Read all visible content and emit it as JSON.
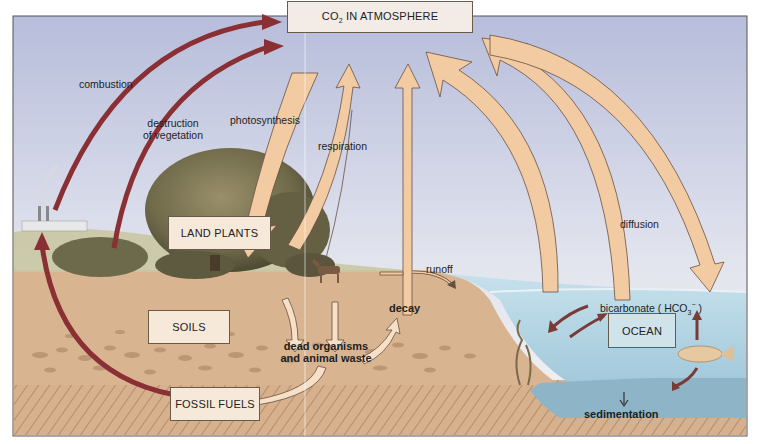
{
  "diagram": {
    "reservoirs": {
      "atmosphere": {
        "label_prefix": "CO",
        "label_sub": "2",
        "label_suffix": " IN ATMOSPHERE"
      },
      "land_plants": {
        "label": "LAND PLANTS"
      },
      "soils": {
        "label": "SOILS"
      },
      "fossil_fuels": {
        "label": "FOSSIL FUELS"
      },
      "ocean": {
        "label": "OCEAN"
      }
    },
    "processes": {
      "combustion": "combustion",
      "destruction_line1": "destruction",
      "destruction_line2": "of vegetation",
      "photosynthesis": "photosynthesis",
      "respiration": "respiration",
      "decay_top": "decay",
      "runoff": "runoff",
      "diffusion": "diffusion",
      "dead_line1": "dead organisms",
      "dead_line2": "and animal waste",
      "bicarbonate_prefix": "bicarbonate ( HCO",
      "bicarbonate_sub": "3",
      "bicarbonate_sup": "−",
      "bicarbonate_suffix": " )",
      "sedimentation": "sedimentation"
    },
    "colors": {
      "sky_top": "#b9bfdc",
      "sky_bottom": "#eef0f2",
      "soil": "#d9b592",
      "soil_dark": "#b88e6a",
      "bedrock_hatch": "#a07a5a",
      "ocean": "#a9cfe0",
      "ocean_floor": "#8fb6c8",
      "flow_arrow": "#f2c9a0",
      "flow_arrow_stroke": "#7a5a3a",
      "combustion_arrow": "#8c2a2a",
      "box_fill": "#f6e9d9"
    }
  }
}
